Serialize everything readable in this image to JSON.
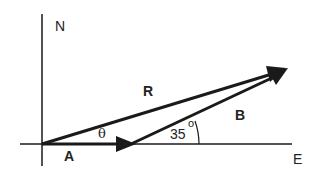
{
  "diagram": {
    "axes": {
      "north_label": "N",
      "east_label": "E"
    },
    "vectors": {
      "A": {
        "label": "A"
      },
      "B": {
        "label": "B"
      },
      "R": {
        "label": "R"
      }
    },
    "angles": {
      "theta": {
        "label": "θ"
      },
      "b_angle": {
        "label": "35",
        "degree_symbol": "o"
      }
    },
    "colors": {
      "stroke": "#1a1a1a",
      "background": "#ffffff"
    }
  }
}
